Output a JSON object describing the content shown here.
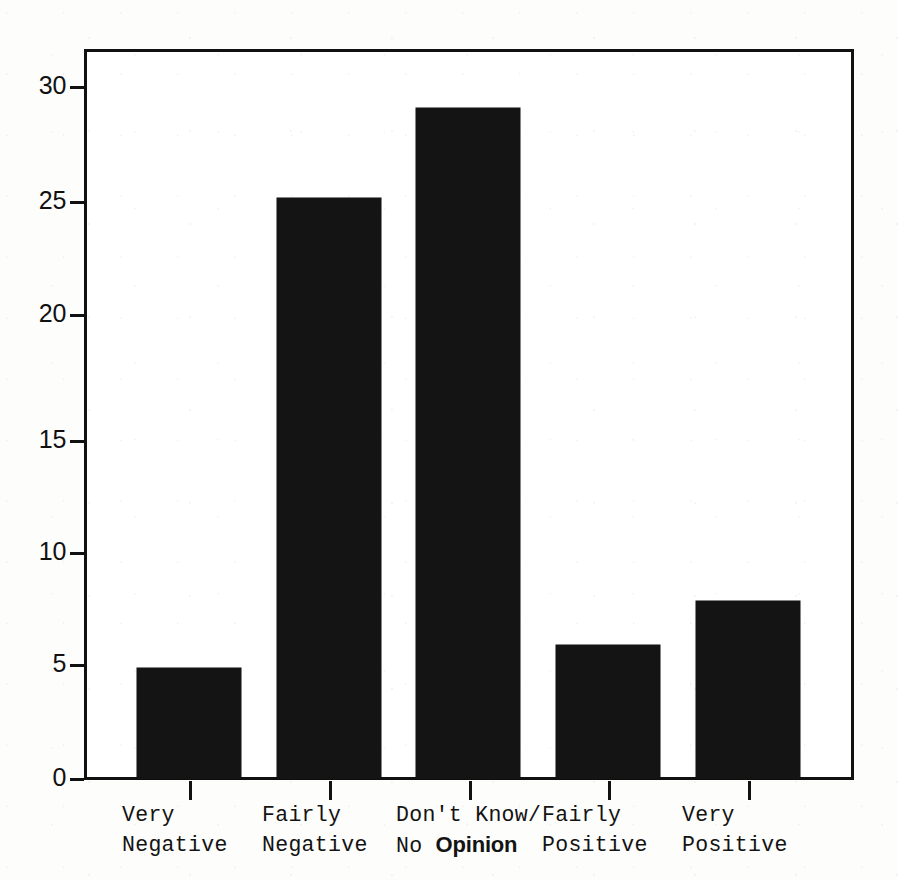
{
  "chart_data": {
    "type": "bar",
    "title": "",
    "subtitle": "",
    "xlabel": "",
    "ylabel": "",
    "categories": [
      "Very Negative",
      "Fairly Negative",
      "Don't Know/ No Opinion",
      "Fairly Positive",
      "Very Positive"
    ],
    "category_lines": [
      [
        "Very",
        "Negative"
      ],
      [
        "Fairly",
        "Negative"
      ],
      [
        "Don't Know/",
        "No Opinion"
      ],
      [
        "Fairly",
        "Positive"
      ],
      [
        "Very",
        "Positive"
      ]
    ],
    "values": [
      5,
      26,
      30,
      6,
      8
    ],
    "ylim": [
      0,
      32.8
    ],
    "yticks": [
      0,
      5,
      10,
      15,
      20,
      25,
      30
    ],
    "ytick_labels": [
      "0",
      "5",
      "10",
      "15",
      "20",
      "25",
      "30"
    ],
    "grid": false,
    "legend": false,
    "legend_position": "none",
    "bar_color": "#141414",
    "axis_color": "#111111",
    "background_color": "#ffffff"
  },
  "annotations": {
    "patched_word": "Opinion",
    "patched_word_note_line1": "Don't Know/",
    "patched_word_prefix": "No "
  },
  "bar_labels": {
    "b0_line1": "Very",
    "b0_line2": "Negative",
    "b1_line1": "Fairly",
    "b1_line2": "Negative",
    "b2_line1": "Don't Know/",
    "b2_line2_prefix": "No ",
    "b2_line2_patched": "Opinion",
    "b3_line1": "Fairly",
    "b3_line2": "Positive",
    "b4_line1": "Very",
    "b4_line2": "Positive"
  },
  "ytick_text": {
    "t0": "0",
    "t5": "5",
    "t10": "10",
    "t15": "15",
    "t20": "20",
    "t25": "25",
    "t30": "30"
  }
}
